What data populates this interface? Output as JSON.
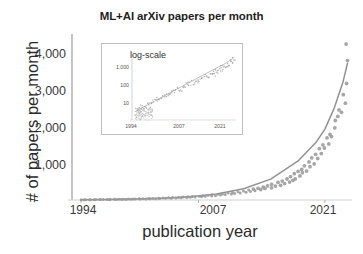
{
  "chart_data": {
    "type": "scatter",
    "title": "ML+AI arXiv papers per month",
    "xlabel": "publication year",
    "ylabel": "# of papers per month",
    "xlim": [
      1993.0,
      2024.0
    ],
    "ylim": [
      0,
      4800
    ],
    "grid": false,
    "legend": null,
    "marker_color": "#9a9a9a",
    "trend_color": "#8c8c8c",
    "axis_color": "#808080",
    "xticks": [
      1994,
      2007,
      2021
    ],
    "xticklabels": [
      "1994",
      "2007",
      "2021"
    ],
    "yticks": [
      1000,
      2000,
      3000,
      4000
    ],
    "yticklabels": [
      "1,000",
      "2,000",
      "3,000",
      "4,000"
    ],
    "series": [
      {
        "name": "monthly ML+AI arXiv submissions",
        "note": "monthly counts, exponential growth ~1994-2023",
        "x": [
          1994.0,
          1994.3,
          1994.6,
          1994.9,
          1995.1,
          1995.4,
          1995.7,
          1996.0,
          1996.2,
          1996.5,
          1996.8,
          1997.1,
          1997.3,
          1997.6,
          1997.9,
          1998.2,
          1998.4,
          1998.7,
          1999.0,
          1999.3,
          1999.5,
          1999.8,
          2000.1,
          2000.4,
          2000.6,
          2000.9,
          2001.2,
          2001.5,
          2001.7,
          2002.0,
          2002.3,
          2002.6,
          2002.8,
          2003.1,
          2003.4,
          2003.7,
          2003.9,
          2004.2,
          2004.5,
          2004.8,
          2005.0,
          2005.3,
          2005.6,
          2005.9,
          2006.1,
          2006.4,
          2006.7,
          2007.0,
          2007.3,
          2007.5,
          2007.8,
          2008.1,
          2008.4,
          2008.6,
          2008.9,
          2009.2,
          2009.5,
          2009.7,
          2010.0,
          2010.3,
          2010.6,
          2010.8,
          2011.1,
          2011.4,
          2011.7,
          2011.9,
          2012.2,
          2012.5,
          2012.8,
          2013.0,
          2013.3,
          2013.6,
          2013.9,
          2014.1,
          2014.4,
          2014.7,
          2015.0,
          2015.2,
          2015.5,
          2015.8,
          2016.0,
          2016.3,
          2016.6,
          2016.8,
          2017.0,
          2017.2,
          2017.4,
          2017.6,
          2017.8,
          2018.0,
          2018.2,
          2018.4,
          2018.6,
          2018.8,
          2019.0,
          2019.2,
          2019.4,
          2019.6,
          2019.8,
          2020.0,
          2020.2,
          2020.4,
          2020.6,
          2020.8,
          2021.0,
          2021.2,
          2021.4,
          2021.6,
          2021.8,
          2022.0,
          2022.2,
          2022.4,
          2022.6,
          2022.8,
          2023.0,
          2023.2,
          2023.4,
          2023.6
        ],
        "y": [
          6,
          5,
          9,
          7,
          11,
          8,
          13,
          10,
          15,
          12,
          18,
          14,
          11,
          20,
          16,
          22,
          17,
          25,
          19,
          28,
          23,
          31,
          26,
          35,
          29,
          38,
          33,
          42,
          36,
          46,
          40,
          52,
          44,
          58,
          49,
          64,
          55,
          71,
          60,
          78,
          66,
          86,
          73,
          95,
          80,
          104,
          88,
          115,
          97,
          126,
          107,
          139,
          118,
          152,
          130,
          168,
          143,
          184,
          158,
          202,
          173,
          222,
          191,
          244,
          210,
          268,
          231,
          295,
          254,
          324,
          279,
          357,
          307,
          392,
          337,
          431,
          370,
          474,
          407,
          521,
          447,
          573,
          492,
          630,
          540,
          694,
          595,
          764,
          640,
          840,
          705,
          925,
          790,
          1018,
          860,
          1120,
          985,
          1233,
          1080,
          1357,
          1210,
          1493,
          1340,
          1644,
          1520,
          1810,
          1680,
          1992,
          1890,
          2193,
          2380,
          2414,
          2700,
          2658,
          3050,
          2926,
          3400,
          4050
        ],
        "outliers": [
          {
            "x": 2023.35,
            "y": 4620,
            "note": "single high outlier near right edge"
          }
        ]
      },
      {
        "name": "fitted exponential trend",
        "type": "line",
        "x": [
          1994,
          1997,
          2000,
          2003,
          2006,
          2009,
          2012,
          2015,
          2018,
          2020,
          2021,
          2022,
          2023,
          2023.5
        ],
        "y": [
          8,
          15,
          28,
          52,
          97,
          180,
          335,
          620,
          1150,
          1700,
          2100,
          2700,
          3500,
          4050
        ]
      }
    ]
  },
  "inset": {
    "title": "log-scale",
    "type": "scatter",
    "yscale": "log",
    "xticklabels": [
      "1994",
      "2007",
      "2021"
    ],
    "yticklabels": [
      "1,000",
      "100",
      "10"
    ],
    "ylim": [
      3,
      6000
    ],
    "xlim": [
      1993.0,
      2024.0
    ]
  }
}
